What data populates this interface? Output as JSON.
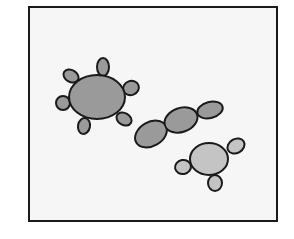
{
  "diagram": {
    "background": "#ffffff",
    "frame": {
      "x": 29,
      "y": 7,
      "width": 248,
      "height": 214,
      "fill": "#f6f6f6",
      "stroke": "#1a1a1a",
      "stroke_width": 2
    },
    "colors": {
      "outline": "#1a1a1a",
      "dark_fill": "#9a9a9a",
      "light_fill": "#c4c4c4"
    },
    "cells": [
      {
        "name": "cell-with-six-buds",
        "body": {
          "cx": 97,
          "cy": 97,
          "rx": 28,
          "ry": 22
        },
        "fill": "dark",
        "buds": [
          {
            "cx": 103,
            "cy": 67,
            "rx": 6,
            "ry": 9,
            "rot": 0
          },
          {
            "cx": 71,
            "cy": 76,
            "rx": 8,
            "ry": 6,
            "rot": 30
          },
          {
            "cx": 131,
            "cy": 88,
            "rx": 8,
            "ry": 7,
            "rot": -20
          },
          {
            "cx": 63,
            "cy": 103,
            "rx": 7,
            "ry": 7,
            "rot": 0
          },
          {
            "cx": 124,
            "cy": 119,
            "rx": 8,
            "ry": 6,
            "rot": 30
          },
          {
            "cx": 84,
            "cy": 126,
            "rx": 6,
            "ry": 8,
            "rot": 10
          }
        ]
      },
      {
        "name": "chain-of-cells",
        "fill": "dark",
        "segments": [
          {
            "cx": 151,
            "cy": 134,
            "rx": 17,
            "ry": 12,
            "rot": -30
          },
          {
            "cx": 181,
            "cy": 120,
            "rx": 17,
            "ry": 12,
            "rot": -20
          },
          {
            "cx": 210,
            "cy": 110,
            "rx": 13,
            "ry": 8,
            "rot": -15
          }
        ]
      },
      {
        "name": "cell-with-three-buds",
        "body": {
          "cx": 209,
          "cy": 159,
          "rx": 19,
          "ry": 16
        },
        "fill": "light",
        "buds": [
          {
            "cx": 236,
            "cy": 146,
            "rx": 9,
            "ry": 7,
            "rot": -30
          },
          {
            "cx": 183,
            "cy": 167,
            "rx": 8,
            "ry": 7,
            "rot": -10
          },
          {
            "cx": 215,
            "cy": 183,
            "rx": 7,
            "ry": 8,
            "rot": 0
          }
        ]
      }
    ]
  }
}
